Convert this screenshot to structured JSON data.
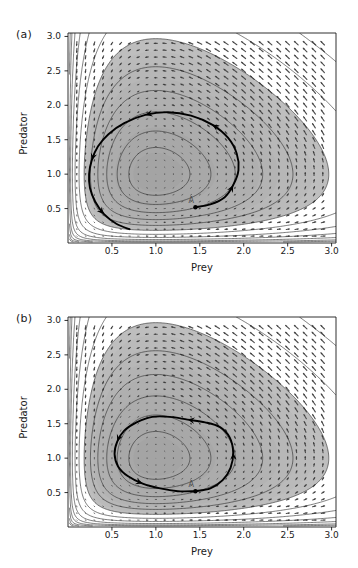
{
  "figure": {
    "background": "#ffffff",
    "caption_fragment": ""
  },
  "chart_data": [
    {
      "id": "panel-a",
      "type": "line",
      "panel_label": "(a)",
      "title": "",
      "xlabel": "Prey",
      "ylabel": "Predator",
      "xlim": [
        0.0,
        3.05
      ],
      "ylim": [
        0.0,
        3.05
      ],
      "xticks": [
        0.5,
        1.0,
        1.5,
        2.0,
        2.5,
        3.0
      ],
      "xtick_labels": [
        "0.5",
        "1.0",
        "1.5",
        "2.0",
        "2.5",
        "3.0"
      ],
      "yticks": [
        0.5,
        1.0,
        1.5,
        2.0,
        2.5,
        3.0
      ],
      "ytick_labels": [
        "0.5",
        "1.0",
        "1.5",
        "2.0",
        "2.5",
        "3.0"
      ],
      "grid": false,
      "legend": "none",
      "background_field": {
        "kind": "shaded-contour",
        "shading": "grayscale, darkest near center-left, lightest toward upper-right",
        "center": [
          1.02,
          1.12
        ],
        "contour_levels": 14,
        "contour_color": "#2a2a2a"
      },
      "vector_field": {
        "kind": "quiver-dot-grid",
        "grid_spacing": 0.1,
        "marker_color": "#555555",
        "note": "arrow magnitude grows toward upper-right corner"
      },
      "trajectory": {
        "name": "outward spiral from A",
        "start_point": [
          1.45,
          0.52
        ],
        "start_label": "A",
        "direction": "counter-clockwise, spiralling outward",
        "arrow_count": 5,
        "color": "#000000",
        "points": [
          [
            1.45,
            0.52
          ],
          [
            1.62,
            0.56
          ],
          [
            1.78,
            0.66
          ],
          [
            1.88,
            0.84
          ],
          [
            1.94,
            1.06
          ],
          [
            1.92,
            1.3
          ],
          [
            1.82,
            1.53
          ],
          [
            1.64,
            1.72
          ],
          [
            1.4,
            1.85
          ],
          [
            1.14,
            1.9
          ],
          [
            0.88,
            1.86
          ],
          [
            0.64,
            1.74
          ],
          [
            0.46,
            1.58
          ],
          [
            0.34,
            1.4
          ],
          [
            0.27,
            1.2
          ],
          [
            0.24,
            1.0
          ],
          [
            0.25,
            0.8
          ],
          [
            0.31,
            0.6
          ],
          [
            0.41,
            0.42
          ],
          [
            0.55,
            0.28
          ],
          [
            0.7,
            0.2
          ]
        ]
      },
      "equilibrium_marker": {
        "point": [
          1.45,
          0.52
        ],
        "style": "filled-dot"
      }
    },
    {
      "id": "panel-b",
      "type": "line",
      "panel_label": "(b)",
      "title": "",
      "xlabel": "Prey",
      "ylabel": "Predator",
      "xlim": [
        0.0,
        3.05
      ],
      "ylim": [
        0.0,
        3.05
      ],
      "xticks": [
        0.5,
        1.0,
        1.5,
        2.0,
        2.5,
        3.0
      ],
      "xtick_labels": [
        "0.5",
        "1.0",
        "1.5",
        "2.0",
        "2.5",
        "3.0"
      ],
      "yticks": [
        0.5,
        1.0,
        1.5,
        2.0,
        2.5,
        3.0
      ],
      "ytick_labels": [
        "0.5",
        "1.0",
        "1.5",
        "2.0",
        "2.5",
        "3.0"
      ],
      "grid": false,
      "legend": "none",
      "background_field": {
        "kind": "shaded-contour",
        "shading": "grayscale, darkest near center-left, lightest toward upper-right",
        "center": [
          1.02,
          1.12
        ],
        "contour_levels": 14,
        "contour_color": "#2a2a2a"
      },
      "vector_field": {
        "kind": "quiver-dot-grid",
        "grid_spacing": 0.1,
        "marker_color": "#555555",
        "note": "arrow magnitude grows toward upper-right corner"
      },
      "trajectory": {
        "name": "closed orbit through A",
        "start_point": [
          1.45,
          0.52
        ],
        "start_label": "A",
        "direction": "counter-clockwise, closed periodic orbit",
        "arrow_count": 4,
        "color": "#000000",
        "points": [
          [
            1.45,
            0.52
          ],
          [
            1.62,
            0.56
          ],
          [
            1.76,
            0.68
          ],
          [
            1.85,
            0.86
          ],
          [
            1.88,
            1.08
          ],
          [
            1.84,
            1.3
          ],
          [
            1.73,
            1.45
          ],
          [
            1.56,
            1.52
          ],
          [
            1.36,
            1.56
          ],
          [
            1.16,
            1.6
          ],
          [
            0.96,
            1.6
          ],
          [
            0.78,
            1.52
          ],
          [
            0.64,
            1.4
          ],
          [
            0.56,
            1.24
          ],
          [
            0.53,
            1.06
          ],
          [
            0.57,
            0.88
          ],
          [
            0.68,
            0.74
          ],
          [
            0.85,
            0.63
          ],
          [
            1.05,
            0.56
          ],
          [
            1.25,
            0.52
          ],
          [
            1.45,
            0.52
          ]
        ]
      },
      "equilibrium_marker": {
        "point": [
          1.45,
          0.52
        ],
        "style": "filled-dot"
      }
    }
  ]
}
